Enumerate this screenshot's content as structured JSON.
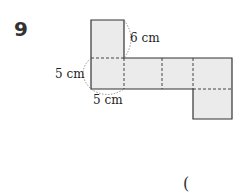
{
  "problem": {
    "number": "9",
    "answer_paren": "("
  },
  "diagram": {
    "type": "cube-net",
    "fill_color": "#ebebeb",
    "edge_color": "#333333",
    "labels": {
      "top_edge": "6 cm",
      "left_edge": "5 cm",
      "bottom_edge": "5 cm"
    }
  }
}
